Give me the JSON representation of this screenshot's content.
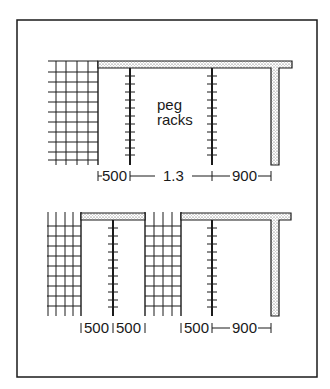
{
  "figure": {
    "type": "plan-diagram",
    "colors": {
      "line": "#1a1a1a",
      "wall_fill": "#d8d8d8",
      "background": "#ffffff"
    }
  },
  "top_plan": {
    "label_line1": "peg",
    "label_line2": "racks",
    "dimensions": [
      {
        "name": "first-gap",
        "text": "500"
      },
      {
        "name": "middle-span",
        "text": "1.3"
      },
      {
        "name": "end-gap",
        "text": "900"
      }
    ],
    "elements": [
      "grid-shelving",
      "wall-top",
      "peg-rack-left",
      "peg-rack-right",
      "wall-return"
    ]
  },
  "bottom_plan": {
    "dimensions": [
      {
        "name": "gap-a",
        "text": "500"
      },
      {
        "name": "gap-b",
        "text": "500"
      },
      {
        "name": "gap-c",
        "text": "500"
      },
      {
        "name": "end-gap",
        "text": "900"
      }
    ],
    "elements": [
      "grid-shelving-left",
      "peg-rack-1",
      "grid-shelving-middle",
      "peg-rack-2",
      "wall-top",
      "wall-return"
    ]
  }
}
